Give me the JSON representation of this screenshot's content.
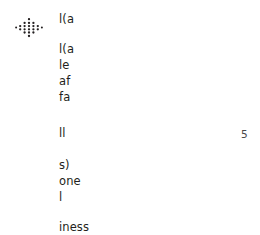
{
  "page": {
    "background_color": "#ffffff",
    "text_color": "#231f20"
  },
  "logo": {
    "icon": "diamond-dot-lattice-icon",
    "color": "#231f20"
  },
  "content": {
    "title_fragment": "l(a",
    "block_one": [
      "l(a",
      "le",
      "af",
      "fa"
    ],
    "middle_fragment": "ll",
    "block_two": [
      "s)",
      "one",
      "l"
    ],
    "tail_fragment": "iness"
  },
  "side": {
    "number": "5",
    "color": "#4a4a4a"
  }
}
